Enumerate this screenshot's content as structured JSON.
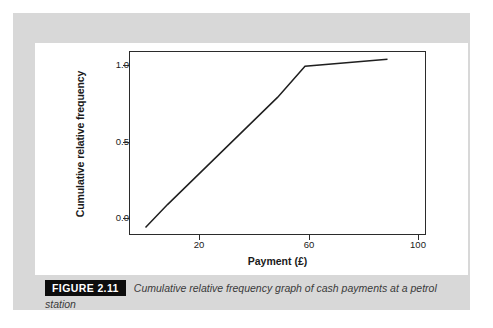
{
  "figure": {
    "tag": "FIGURE 2.11",
    "caption_line_1": "Cumulative relative frequency graph of cash payments at a petrol",
    "caption_line_2": "station"
  },
  "colors": {
    "panel_background": "#d8d8d8",
    "card_background": "#ffffff",
    "axis": "#2b2b2b",
    "line": "#1f1f1f",
    "tag_background": "#0d0d0d",
    "tag_text": "#ffffff",
    "caption_text": "#3a3a3a"
  },
  "chart_data": {
    "type": "line",
    "title": "",
    "xlabel": "Payment (£)",
    "ylabel": "Cumulative relative frequency",
    "xlim": [
      6,
      114
    ],
    "ylim": [
      -0.05,
      1.16
    ],
    "xticks": [
      20,
      60,
      100
    ],
    "xtick_labels": [
      "20",
      "60",
      "100"
    ],
    "yticks": [
      0.0,
      0.5,
      1.0
    ],
    "ytick_labels": [
      "0.0",
      "0.5",
      "1.0"
    ],
    "grid": false,
    "legend": false,
    "series": [
      {
        "name": "Cumulative relative frequency",
        "x": [
          12,
          20,
          60,
          70,
          100
        ],
        "y": [
          0.0,
          0.15,
          0.855,
          1.06,
          1.105
        ]
      }
    ]
  }
}
